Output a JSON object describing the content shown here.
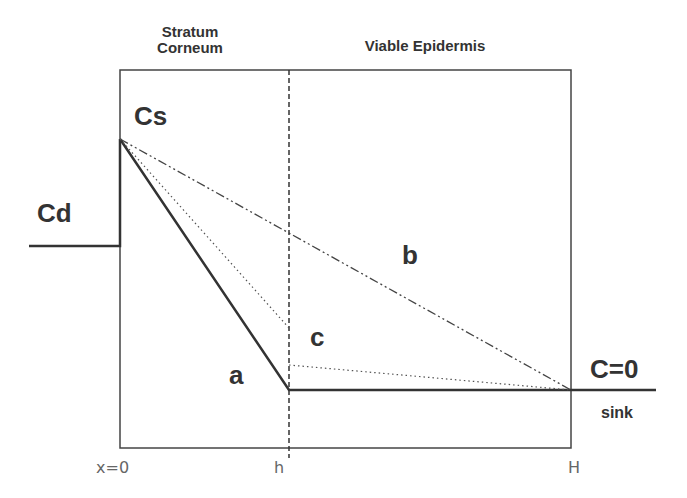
{
  "diagram": {
    "regions": {
      "stratum_corneum": "Stratum\nCorneum",
      "stratum_corneum_line1": "Stratum",
      "stratum_corneum_line2": "Corneum",
      "viable_epidermis": "Viable Epidermis"
    },
    "labels": {
      "cs": "Cs",
      "cd": "Cd",
      "a": "a",
      "b": "b",
      "c": "c",
      "c_zero": "C=0",
      "sink": "sink"
    },
    "axis_ticks": {
      "x0": "x=0",
      "h": "h",
      "H": "H"
    },
    "profiles": [
      {
        "id": "a",
        "style": "solid",
        "description": "Cs at x=0 to 0 at x=h, then 0 to H"
      },
      {
        "id": "b",
        "style": "dash-dot",
        "description": "Cs at x=0 linearly to 0 at x=H"
      },
      {
        "id": "c",
        "style": "dotted",
        "description": "Cs at x=0 to partial at h, discontinuity, then to 0 at H"
      }
    ],
    "colors": {
      "line": "#333333",
      "text": "#333333",
      "axis_text": "#666666"
    }
  }
}
